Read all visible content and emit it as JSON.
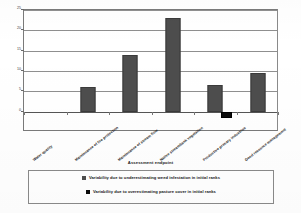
{
  "chart_data": {
    "type": "bar",
    "title": "",
    "xlabel": "Assessment endpoint",
    "ylabel": "",
    "ylim": [
      -5,
      25
    ],
    "yticks": [
      0,
      5,
      10,
      15,
      20,
      25
    ],
    "ytick_labels": [
      "0",
      "5",
      "10",
      "15",
      "20",
      "25"
    ],
    "grid": true,
    "legend_position": "bottom",
    "categories": [
      "Water quality",
      "Maintenance of fire protection",
      "Maintenance of stream flow",
      "Native streambank vegetation",
      "Productive primary industries",
      "Good resource management"
    ],
    "series": [
      {
        "name": "Variability due to underestimating weed infestation in initial ranks",
        "color": "#4d4d4d",
        "values": [
          0,
          6,
          14,
          23,
          6.5,
          9.5
        ]
      },
      {
        "name": "Variability due to overestimating pasture cover in initial ranks",
        "color": "#0b0b0b",
        "values": [
          0,
          0,
          0,
          0,
          -1.6,
          0
        ]
      }
    ]
  },
  "axis": {
    "ticks": [
      {
        "label": "25",
        "value": 25
      },
      {
        "label": "20",
        "value": 20
      },
      {
        "label": "15",
        "value": 15
      },
      {
        "label": "10",
        "value": 10
      },
      {
        "label": "5",
        "value": 5
      },
      {
        "label": "0",
        "value": 0
      }
    ],
    "x_title": "Assessment endpoint"
  },
  "categories": [
    {
      "label": "Water quality"
    },
    {
      "label": "Maintenance of fire protection"
    },
    {
      "label": "Maintenance of stream flow"
    },
    {
      "label": "Native streambank vegetation"
    },
    {
      "label": "Productive primary industries"
    },
    {
      "label": "Good resource management"
    }
  ],
  "legend": {
    "entries": [
      {
        "label": "Variability due to underestimating weed infestation in initial ranks",
        "color": "#4d4d4d"
      },
      {
        "label": "Variability due to overestimating pasture cover in initial ranks",
        "color": "#0b0b0b"
      }
    ]
  }
}
